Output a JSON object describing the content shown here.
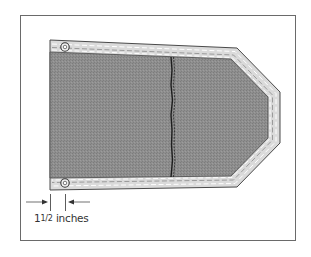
{
  "figure": {
    "dimension_label": {
      "whole": "1",
      "fraction": "1/2",
      "unit": "inches",
      "full_text": "1½ inches"
    },
    "colors": {
      "frame": "#6a6a6a",
      "hem": "#dcdcdc",
      "fabric": "#8c8c8c",
      "outline": "#4a4a4a",
      "stitch": "#ffffff",
      "seam": "#1e1e1e"
    },
    "parts": [
      "hem-border",
      "fabric-panel",
      "center-seam",
      "grommet-top",
      "grommet-bottom",
      "dimension-arrows"
    ]
  }
}
